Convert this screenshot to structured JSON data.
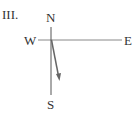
{
  "figure": {
    "label": "III.",
    "compass": {
      "north": "N",
      "south": "S",
      "east": "E",
      "west": "W"
    },
    "arrow": {
      "direction": "south-southeast",
      "color": "#666666"
    }
  }
}
